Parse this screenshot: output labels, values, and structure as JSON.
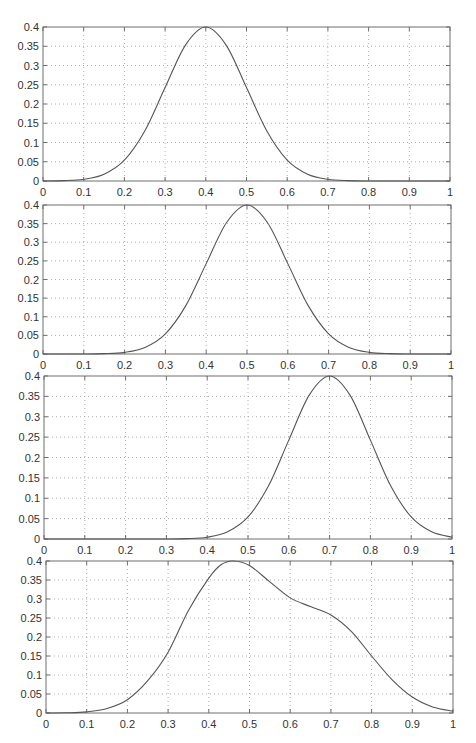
{
  "figure": {
    "width": 476,
    "height": 743,
    "colors": {
      "axis": "#6e6e6e",
      "grid": "#9a9a9a",
      "curve": "#555555",
      "text": "#333333"
    }
  },
  "chart_data": [
    {
      "type": "line",
      "title": "",
      "xlabel": "",
      "ylabel": "",
      "xlim": [
        0,
        1
      ],
      "ylim": [
        0,
        0.4
      ],
      "grid": true,
      "legend": null,
      "xticks": [
        "0",
        "0.1",
        "0.2",
        "0.3",
        "0.4",
        "0.5",
        "0.6",
        "0.7",
        "0.8",
        "0.9",
        "1"
      ],
      "yticks": [
        "0",
        "0.05",
        "0.1",
        "0.15",
        "0.2",
        "0.25",
        "0.3",
        "0.35",
        "0.4"
      ],
      "description": "Gaussian bump centered at 0.4",
      "series": [
        {
          "name": "density",
          "x": [
            0,
            0.05,
            0.1,
            0.15,
            0.2,
            0.25,
            0.3,
            0.35,
            0.4,
            0.45,
            0.5,
            0.55,
            0.6,
            0.65,
            0.7,
            0.75,
            0.8,
            0.85,
            0.9,
            0.95,
            1.0
          ],
          "values": [
            0.0001,
            0.0009,
            0.0044,
            0.0176,
            0.0541,
            0.1298,
            0.2426,
            0.353,
            0.4,
            0.353,
            0.2426,
            0.1298,
            0.0541,
            0.0176,
            0.0044,
            0.0009,
            0.0001,
            0.0,
            0.0,
            0.0,
            0.0
          ]
        }
      ],
      "plot_box": {
        "left": 43,
        "right": 450,
        "top": 27,
        "bottom": 181
      }
    },
    {
      "type": "line",
      "title": "",
      "xlabel": "",
      "ylabel": "",
      "xlim": [
        0,
        1
      ],
      "ylim": [
        0,
        0.4
      ],
      "grid": true,
      "legend": null,
      "xticks": [
        "0",
        "0.1",
        "0.2",
        "0.3",
        "0.4",
        "0.5",
        "0.6",
        "0.7",
        "0.8",
        "0.9",
        "1"
      ],
      "yticks": [
        "0",
        "0.05",
        "0.1",
        "0.15",
        "0.2",
        "0.25",
        "0.3",
        "0.35",
        "0.4"
      ],
      "description": "Gaussian bump centered at 0.5",
      "series": [
        {
          "name": "density",
          "x": [
            0,
            0.05,
            0.1,
            0.15,
            0.2,
            0.25,
            0.3,
            0.35,
            0.4,
            0.45,
            0.5,
            0.55,
            0.6,
            0.65,
            0.7,
            0.75,
            0.8,
            0.85,
            0.9,
            0.95,
            1.0
          ],
          "values": [
            0.0,
            0.0,
            0.0001,
            0.0009,
            0.0044,
            0.0176,
            0.0541,
            0.1298,
            0.2426,
            0.353,
            0.4,
            0.353,
            0.2426,
            0.1298,
            0.0541,
            0.0176,
            0.0044,
            0.0009,
            0.0001,
            0.0,
            0.0
          ]
        }
      ],
      "plot_box": {
        "left": 43,
        "right": 451,
        "top": 205,
        "bottom": 354
      }
    },
    {
      "type": "line",
      "title": "",
      "xlabel": "",
      "ylabel": "",
      "xlim": [
        0,
        1
      ],
      "ylim": [
        0,
        0.4
      ],
      "grid": true,
      "legend": null,
      "xticks": [
        "0",
        "0.1",
        "0.2",
        "0.3",
        "0.4",
        "0.5",
        "0.6",
        "0.7",
        "0.8",
        "0.9",
        "1"
      ],
      "yticks": [
        "0",
        "0.05",
        "0.1",
        "0.15",
        "0.2",
        "0.25",
        "0.3",
        "0.35",
        "0.4"
      ],
      "description": "Gaussian bump centered at 0.7",
      "series": [
        {
          "name": "density",
          "x": [
            0,
            0.05,
            0.1,
            0.15,
            0.2,
            0.25,
            0.3,
            0.35,
            0.4,
            0.45,
            0.5,
            0.55,
            0.6,
            0.65,
            0.7,
            0.75,
            0.8,
            0.85,
            0.9,
            0.95,
            1.0
          ],
          "values": [
            0.0,
            0.0,
            0.0,
            0.0,
            0.0,
            0.0,
            0.0001,
            0.0009,
            0.0044,
            0.0176,
            0.0541,
            0.1298,
            0.2426,
            0.353,
            0.4,
            0.353,
            0.2426,
            0.1298,
            0.0541,
            0.0176,
            0.0044
          ]
        }
      ],
      "plot_box": {
        "left": 44,
        "right": 452,
        "top": 376,
        "bottom": 539
      }
    },
    {
      "type": "line",
      "title": "",
      "xlabel": "",
      "ylabel": "",
      "xlim": [
        0,
        1
      ],
      "ylim": [
        0,
        0.4
      ],
      "grid": true,
      "legend": null,
      "xticks": [
        "0",
        "0.1",
        "0.2",
        "0.3",
        "0.4",
        "0.5",
        "0.6",
        "0.7",
        "0.8",
        "0.9",
        "1"
      ],
      "yticks": [
        "0",
        "0.05",
        "0.1",
        "0.15",
        "0.2",
        "0.25",
        "0.3",
        "0.35",
        "0.4"
      ],
      "description": "Bimodal mixture: main peak near 0.46, shoulder near 0.7",
      "series": [
        {
          "name": "density",
          "x": [
            0,
            0.05,
            0.1,
            0.15,
            0.2,
            0.25,
            0.3,
            0.35,
            0.4,
            0.43,
            0.46,
            0.5,
            0.55,
            0.6,
            0.65,
            0.7,
            0.75,
            0.8,
            0.85,
            0.9,
            0.95,
            1.0
          ],
          "values": [
            0.0,
            0.0005,
            0.003,
            0.012,
            0.035,
            0.085,
            0.16,
            0.27,
            0.355,
            0.39,
            0.4,
            0.388,
            0.345,
            0.303,
            0.28,
            0.258,
            0.215,
            0.15,
            0.088,
            0.042,
            0.016,
            0.005
          ]
        }
      ],
      "plot_box": {
        "left": 46,
        "right": 453,
        "top": 561,
        "bottom": 713
      }
    }
  ]
}
